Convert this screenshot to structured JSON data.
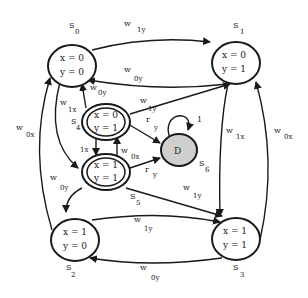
{
  "diagram": {
    "type": "state-machine",
    "states": [
      {
        "id": "S0",
        "name": "S",
        "sub": "0",
        "line1": "x = 0",
        "line2": "y = 0",
        "kind": "normal"
      },
      {
        "id": "S1",
        "name": "S",
        "sub": "1",
        "line1": "x = 0",
        "line2": "y = 1",
        "kind": "normal"
      },
      {
        "id": "S2",
        "name": "S",
        "sub": "2",
        "line1": "x = 1",
        "line2": "y = 0",
        "kind": "normal"
      },
      {
        "id": "S3",
        "name": "S",
        "sub": "3",
        "line1": "x = 1",
        "line2": "y = 1",
        "kind": "normal"
      },
      {
        "id": "S4",
        "name": "S",
        "sub": "4",
        "line1": "x = 0",
        "line2": "y = 1",
        "kind": "double"
      },
      {
        "id": "S5",
        "name": "S",
        "sub": "5",
        "line1": "x = 1",
        "line2": "y = 1",
        "kind": "double"
      },
      {
        "id": "S6",
        "name": "S",
        "sub": "6",
        "line1": "D",
        "kind": "shaded"
      }
    ],
    "edges": [
      {
        "from": "S0",
        "to": "S1",
        "label": "w",
        "sub": "1y"
      },
      {
        "from": "S1",
        "to": "S0",
        "label": "w",
        "sub": "0y"
      },
      {
        "from": "S4",
        "to": "S0",
        "label": "w",
        "sub": "0y"
      },
      {
        "from": "S0",
        "to": "S5",
        "label": "w",
        "sub": "1x"
      },
      {
        "from": "S2",
        "to": "S0",
        "label": "w",
        "sub": "0x"
      },
      {
        "from": "S4",
        "to": "S1",
        "label": "w",
        "sub": "1y"
      },
      {
        "from": "S4",
        "to": "S6",
        "label": "r",
        "sub": "y"
      },
      {
        "from": "S4",
        "to": "S5",
        "label": "w",
        "sub": "1x"
      },
      {
        "from": "S5",
        "to": "S4",
        "label": "w",
        "sub": "0x"
      },
      {
        "from": "S5",
        "to": "S6",
        "label": "r",
        "sub": "y"
      },
      {
        "from": "S6",
        "to": "S6",
        "label": "1",
        "sub": ""
      },
      {
        "from": "S1",
        "to": "S3",
        "label": "w",
        "sub": "1x"
      },
      {
        "from": "S3",
        "to": "S1",
        "label": "w",
        "sub": "0x"
      },
      {
        "from": "S5",
        "to": "S2",
        "label": "w",
        "sub": "0y"
      },
      {
        "from": "S5",
        "to": "S3",
        "label": "w",
        "sub": "1y"
      },
      {
        "from": "S2",
        "to": "S3",
        "label": "w",
        "sub": "1y"
      },
      {
        "from": "S3",
        "to": "S2",
        "label": "w",
        "sub": "0y"
      }
    ],
    "colors": {
      "stroke": "#1a1a1a",
      "shaded_fill": "#cfcfcf",
      "background": "#ffffff"
    }
  }
}
